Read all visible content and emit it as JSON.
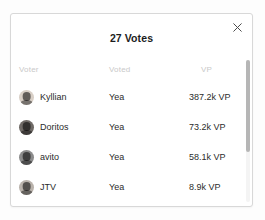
{
  "dialog": {
    "title": "27 Votes",
    "close_icon": "close-icon",
    "close_label": "×"
  },
  "table": {
    "headers": {
      "voter": "Voter",
      "voted": "Voted",
      "vp": "VP"
    },
    "rows": [
      {
        "avatar": "avatar-kyllian",
        "voter": "Kyllian",
        "voted": "Yea",
        "vp": "387.2k VP",
        "avatar_color": "#d8cfc6"
      },
      {
        "avatar": "avatar-doritos",
        "voter": "Doritos",
        "voted": "Yea",
        "vp": "73.2k VP",
        "avatar_color": "#6f6a66"
      },
      {
        "avatar": "avatar-avito",
        "voter": "avito",
        "voted": "Yea",
        "vp": "58.1k VP",
        "avatar_color": "#8c8c8c"
      },
      {
        "avatar": "avatar-jtv",
        "voter": "JTV",
        "voted": "Yea",
        "vp": "8.9k VP",
        "avatar_color": "#b9b2ab"
      }
    ]
  },
  "colors": {
    "dialog_background": "#ffffff",
    "page_background": "#fdfdfd",
    "border": "#d8d8d8",
    "header_text": "#c9c9c9",
    "body_text": "#2b2b2b",
    "title_text": "#1c1c1c",
    "scrollbar_thumb": "#b6b6b6"
  }
}
